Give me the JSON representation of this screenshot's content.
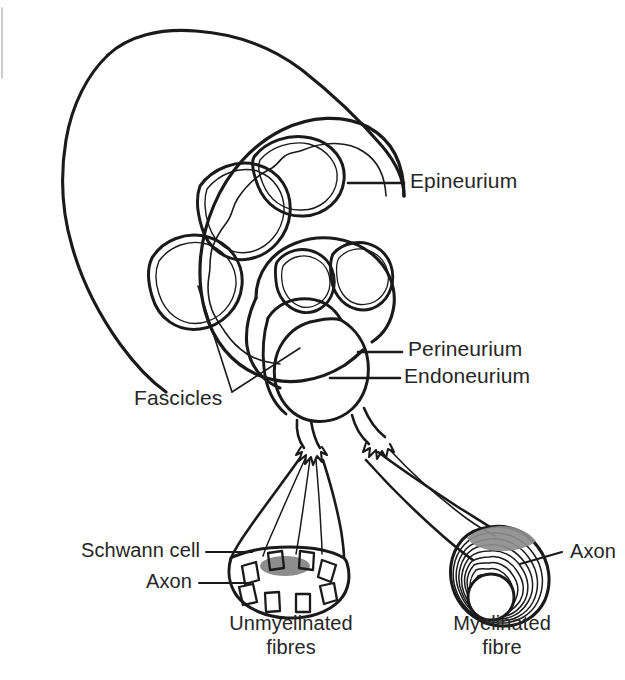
{
  "figure": {
    "kind": "anatomical-line-diagram",
    "background_color": "#ffffff",
    "ink_color": "#1a1a1a",
    "shading_color": "#8a8a8a"
  },
  "labels": {
    "epineurium": "Epineurium",
    "perineurium": "Perineurium",
    "endoneurium": "Endoneurium",
    "fascicles": "Fascicles",
    "schwann_cell": "Schwann cell",
    "axon_left": "Axon",
    "axon_right": "Axon",
    "unmyelinated_line1": "Unmyelinated",
    "unmyelinated_line2": "fibres",
    "myelinated_line1": "Myelinated",
    "myelinated_line2": "fibre"
  },
  "structures": [
    {
      "name": "nerve-trunk",
      "description": "Cut cylindrical peripheral nerve trunk"
    },
    {
      "name": "epineurium-sheath",
      "description": "Outer connective tissue sheath of the whole nerve"
    },
    {
      "name": "fascicle-upper-left",
      "description": "Fascicle in cross-section, upper left"
    },
    {
      "name": "fascicle-upper-right",
      "description": "Fascicle in cross-section, upper right"
    },
    {
      "name": "fascicle-lower-left",
      "description": "Fascicle in cross-section, lower left"
    },
    {
      "name": "fascicle-protruding",
      "description": "Fascicle drawn pulled out of the trunk"
    },
    {
      "name": "fascicle-small-left",
      "description": "Small fascicle in protruding bundle, left"
    },
    {
      "name": "fascicle-small-right",
      "description": "Small fascicle in protruding bundle, right"
    },
    {
      "name": "perineurium-sheath",
      "description": "Sheath surrounding each fascicle"
    },
    {
      "name": "endoneurium-sheath",
      "description": "Connective tissue around individual nerve fibres"
    },
    {
      "name": "unmyelinated-bundle",
      "description": "Unmyelinated fibre bundle with Schwann cell enclosing several axons"
    },
    {
      "name": "myelinated-bundle",
      "description": "Single myelinated fibre with concentric myelin lamellae around one axon"
    }
  ],
  "counts": {
    "fascicles_in_trunk": 5,
    "unmyelinated_axons": 8,
    "myelin_lamellae": 9
  }
}
